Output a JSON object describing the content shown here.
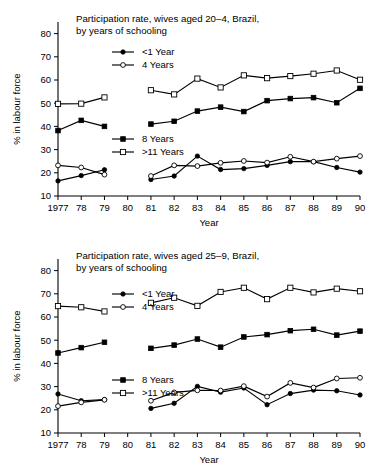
{
  "figure": {
    "panel_count": 2
  },
  "chart_data": [
    {
      "type": "line",
      "title": "Participation rate, wives aged 20–4, Brazil,",
      "subtitle": "by years of schooling",
      "xlabel": "Year",
      "ylabel": "% in labour force",
      "ylim": [
        10,
        85
      ],
      "yticks": [
        10,
        20,
        30,
        40,
        50,
        60,
        70,
        80
      ],
      "ytick_labels": [
        "10",
        "20",
        "30",
        "40",
        "50",
        "60",
        "70",
        "80"
      ],
      "x": [
        1977,
        1978,
        1979,
        1980,
        1981,
        1982,
        1983,
        1984,
        1985,
        1986,
        1987,
        1988,
        1989,
        1990
      ],
      "xtick_labels": [
        "1977",
        "78",
        "79",
        "80",
        "81",
        "82",
        "83",
        "84",
        "85",
        "86",
        "87",
        "88",
        "89",
        "90"
      ],
      "grid": false,
      "legend_position": "inside-upper-left",
      "series": [
        {
          "name": "<1 Year",
          "marker": "filled-circle",
          "x": [
            1977,
            1978,
            1979,
            1981,
            1982,
            1983,
            1984,
            1985,
            1986,
            1987,
            1988,
            1989,
            1990
          ],
          "values": [
            16.5,
            18.8,
            21.3,
            17.1,
            18.6,
            27.2,
            21.4,
            21.8,
            23.2,
            24.8,
            24.8,
            22.3,
            20.3
          ]
        },
        {
          "name": "4 Years",
          "marker": "open-circle",
          "x": [
            1977,
            1978,
            1979,
            1981,
            1982,
            1983,
            1984,
            1985,
            1986,
            1987,
            1988,
            1989,
            1990
          ],
          "values": [
            23.2,
            22.3,
            19.2,
            18.6,
            23.2,
            22.9,
            24.3,
            25.1,
            24.4,
            26.9,
            24.8,
            26.1,
            27.2
          ]
        },
        {
          "name": "8 Years",
          "marker": "filled-square",
          "x": [
            1977,
            1978,
            1979,
            1981,
            1982,
            1983,
            1984,
            1985,
            1986,
            1987,
            1988,
            1989,
            1990
          ],
          "values": [
            38.2,
            42.6,
            40.0,
            41.0,
            42.2,
            46.6,
            48.3,
            46.4,
            51.1,
            52.0,
            52.4,
            50.2,
            56.4
          ]
        },
        {
          "name": ">11 Years",
          "marker": "open-square",
          "x": [
            1977,
            1978,
            1979,
            1981,
            1982,
            1983,
            1984,
            1985,
            1986,
            1987,
            1988,
            1989,
            1990
          ],
          "values": [
            49.7,
            49.8,
            52.5,
            55.6,
            53.8,
            60.6,
            56.8,
            62.0,
            60.8,
            61.7,
            62.7,
            64.1,
            60.1
          ]
        }
      ],
      "legend_groups": [
        {
          "entries": [
            "<1 Year",
            "4 Years"
          ]
        },
        {
          "entries": [
            "8 Years",
            ">11 Years"
          ]
        }
      ]
    },
    {
      "type": "line",
      "title": "Participation rate, wives aged 25–9, Brazil,",
      "subtitle": "by years of schooling",
      "xlabel": "Year",
      "ylabel": "% in labour force",
      "ylim": [
        10,
        85
      ],
      "yticks": [
        10,
        20,
        30,
        40,
        50,
        60,
        70,
        80
      ],
      "ytick_labels": [
        "10",
        "20",
        "30",
        "40",
        "50",
        "60",
        "70",
        "80"
      ],
      "x": [
        1977,
        1978,
        1979,
        1980,
        1981,
        1982,
        1983,
        1984,
        1985,
        1986,
        1987,
        1988,
        1989,
        1990
      ],
      "xtick_labels": [
        "1977",
        "78",
        "79",
        "80",
        "81",
        "82",
        "83",
        "84",
        "85",
        "86",
        "87",
        "88",
        "89",
        "90"
      ],
      "grid": false,
      "legend_position": "inside-upper-left",
      "series": [
        {
          "name": "<1 Year",
          "marker": "filled-circle",
          "x": [
            1977,
            1978,
            1979,
            1981,
            1982,
            1983,
            1984,
            1985,
            1986,
            1987,
            1988,
            1989,
            1990
          ],
          "values": [
            26.8,
            23.9,
            24.4,
            20.6,
            22.8,
            30.1,
            27.6,
            29.4,
            22.2,
            27.0,
            28.5,
            28.2,
            26.4
          ]
        },
        {
          "name": "4 Years",
          "marker": "open-circle",
          "x": [
            1977,
            1978,
            1979,
            1981,
            1982,
            1983,
            1984,
            1985,
            1986,
            1987,
            1988,
            1989,
            1990
          ],
          "values": [
            21.6,
            23.2,
            24.3,
            23.9,
            27.5,
            28.4,
            28.3,
            30.2,
            25.7,
            31.6,
            29.6,
            33.5,
            33.8
          ]
        },
        {
          "name": "8 Years",
          "marker": "filled-square",
          "x": [
            1977,
            1978,
            1979,
            1981,
            1982,
            1983,
            1984,
            1985,
            1986,
            1987,
            1988,
            1989,
            1990
          ],
          "values": [
            44.5,
            46.8,
            49.1,
            46.5,
            47.9,
            50.5,
            47.0,
            51.4,
            52.4,
            54.1,
            54.7,
            52.2,
            53.9
          ]
        },
        {
          "name": ">11 Years",
          "marker": "open-square",
          "x": [
            1977,
            1978,
            1979,
            1981,
            1982,
            1983,
            1984,
            1985,
            1986,
            1987,
            1988,
            1989,
            1990
          ],
          "values": [
            64.7,
            64.2,
            62.4,
            66.1,
            68.3,
            64.8,
            70.8,
            72.6,
            67.7,
            72.6,
            70.6,
            72.2,
            71.1
          ]
        }
      ],
      "legend_groups": [
        {
          "entries": [
            "<1 Year",
            "4 Years"
          ]
        },
        {
          "entries": [
            "8 Years",
            ">11 Years"
          ]
        }
      ]
    }
  ]
}
